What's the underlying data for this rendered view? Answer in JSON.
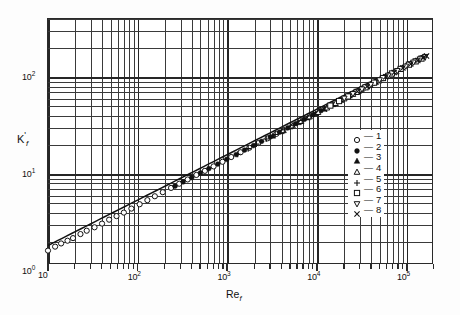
{
  "figure": {
    "background": "#fdfdfd",
    "frame_color": "#2a2a2a",
    "grid_color": "#3a3a3a"
  },
  "axes": {
    "x": {
      "label_text": "Re",
      "label_sub": "f",
      "ticks": [
        {
          "value": 10,
          "text": "10",
          "sup": ""
        },
        {
          "value": 100,
          "text": "10",
          "sup": "2"
        },
        {
          "value": 1000,
          "text": "10",
          "sup": "3"
        },
        {
          "value": 10000,
          "text": "10",
          "sup": "4"
        },
        {
          "value": 100000,
          "text": "10",
          "sup": "5"
        }
      ],
      "range": [
        10,
        200000
      ],
      "scale": "log"
    },
    "y": {
      "label_text": "K",
      "label_prime": "'",
      "label_sub": "f",
      "ticks": [
        {
          "value": 1,
          "text": "10",
          "sup": "0"
        },
        {
          "value": 10,
          "text": "10",
          "sup": "1"
        },
        {
          "value": 100,
          "text": "10",
          "sup": "2"
        }
      ],
      "range": [
        1.15,
        400
      ],
      "scale": "log"
    }
  },
  "legend": {
    "dash": "—",
    "entries": [
      {
        "id": "1",
        "symbol": "open-circle",
        "label": "1"
      },
      {
        "id": "2",
        "symbol": "filled-circle",
        "label": "2"
      },
      {
        "id": "3",
        "symbol": "filled-triangle-up",
        "label": "3"
      },
      {
        "id": "4",
        "symbol": "open-triangle-up",
        "label": "4"
      },
      {
        "id": "5",
        "symbol": "plus",
        "label": "5"
      },
      {
        "id": "6",
        "symbol": "open-square",
        "label": "6"
      },
      {
        "id": "7",
        "symbol": "open-triangle-down",
        "label": "7"
      },
      {
        "id": "8",
        "symbol": "cross",
        "label": "8"
      }
    ]
  },
  "chart_data": {
    "type": "scatter",
    "title": "",
    "subtitle": "",
    "xlabel": "Re_f",
    "ylabel": "K'_f",
    "xscale": "log",
    "yscale": "log",
    "xlim": [
      10,
      200000
    ],
    "ylim": [
      1.15,
      400
    ],
    "grid": true,
    "legend_position": "inside-lower-right",
    "xticks": [
      10,
      100,
      1000,
      10000,
      100000
    ],
    "xticklabels": [
      "10",
      "10^2",
      "10^3",
      "10^4",
      "10^5"
    ],
    "yticks": [
      1,
      10,
      100
    ],
    "yticklabels": [
      "10^0",
      "10^1",
      "10^2"
    ],
    "trendline": {
      "name": "correlation-line",
      "form": "K'_f = a * Re_f^b",
      "a": 0.62,
      "b": 0.47,
      "x_start": 10,
      "x_end": 160000,
      "y_start": 1.55,
      "y_end": 300
    },
    "series": [
      {
        "name": "1",
        "symbol": "open-circle",
        "points": [
          [
            10,
            1.62
          ],
          [
            12,
            1.78
          ],
          [
            14,
            1.92
          ],
          [
            16.5,
            2.05
          ],
          [
            19,
            2.18
          ],
          [
            23,
            2.4
          ],
          [
            27,
            2.6
          ],
          [
            33,
            2.82
          ],
          [
            40,
            3.08
          ],
          [
            48,
            3.38
          ],
          [
            58,
            3.68
          ],
          [
            70,
            4.0
          ],
          [
            85,
            4.4
          ],
          [
            105,
            4.88
          ],
          [
            128,
            5.38
          ],
          [
            155,
            5.9
          ],
          [
            190,
            6.5
          ],
          [
            235,
            7.2
          ],
          [
            290,
            7.95
          ],
          [
            360,
            8.8
          ],
          [
            450,
            9.8
          ],
          [
            560,
            10.8
          ],
          [
            700,
            12.0
          ],
          [
            880,
            13.4
          ],
          [
            1100,
            15.0
          ],
          [
            1400,
            16.8
          ],
          [
            1750,
            18.7
          ],
          [
            2200,
            20.9
          ],
          [
            2800,
            23.4
          ],
          [
            3500,
            26.0
          ]
        ]
      },
      {
        "name": "2",
        "symbol": "filled-circle",
        "points": [
          [
            260,
            7.5
          ],
          [
            320,
            8.3
          ],
          [
            400,
            9.2
          ],
          [
            500,
            10.3
          ],
          [
            620,
            11.4
          ],
          [
            780,
            12.7
          ],
          [
            980,
            14.2
          ],
          [
            1250,
            15.9
          ],
          [
            1550,
            17.7
          ],
          [
            1950,
            19.7
          ],
          [
            2400,
            21.8
          ],
          [
            3000,
            24.2
          ],
          [
            3800,
            27.1
          ],
          [
            4700,
            30.0
          ],
          [
            5800,
            33.2
          ],
          [
            7200,
            36.8
          ],
          [
            9000,
            41.0
          ],
          [
            11000,
            45.2
          ]
        ]
      },
      {
        "name": "3",
        "symbol": "filled-triangle-up",
        "points": [
          [
            3200,
            24.8
          ],
          [
            4000,
            27.6
          ],
          [
            5000,
            30.8
          ],
          [
            6200,
            34.2
          ],
          [
            7800,
            38.2
          ],
          [
            9600,
            42.3
          ],
          [
            12000,
            47.0
          ],
          [
            15000,
            52.5
          ],
          [
            18500,
            58.0
          ],
          [
            23000,
            64.5
          ],
          [
            29000,
            72.0
          ],
          [
            36000,
            80.0
          ],
          [
            45000,
            89.0
          ]
        ]
      },
      {
        "name": "4",
        "symbol": "open-triangle-up",
        "points": [
          [
            4200,
            28.3
          ],
          [
            5300,
            31.6
          ],
          [
            6600,
            35.2
          ],
          [
            8200,
            39.2
          ],
          [
            10200,
            43.6
          ],
          [
            12800,
            48.5
          ],
          [
            16000,
            54.0
          ],
          [
            20000,
            60.2
          ],
          [
            25000,
            67.0
          ],
          [
            31000,
            74.5
          ],
          [
            39000,
            83.0
          ],
          [
            49000,
            92.5
          ],
          [
            61000,
            103.0
          ],
          [
            76000,
            114.5
          ]
        ]
      },
      {
        "name": "5",
        "symbol": "plus",
        "points": [
          [
            1300,
            16.0
          ],
          [
            1700,
            18.3
          ],
          [
            2100,
            20.4
          ],
          [
            2700,
            23.0
          ],
          [
            3400,
            25.6
          ],
          [
            4300,
            28.7
          ],
          [
            5400,
            32.0
          ],
          [
            6800,
            35.8
          ],
          [
            8500,
            39.9
          ],
          [
            34000,
            78.0
          ],
          [
            43000,
            87.5
          ],
          [
            54000,
            97.5
          ]
        ]
      },
      {
        "name": "6",
        "symbol": "open-square",
        "points": [
          [
            14000,
            51.0
          ],
          [
            17500,
            56.8
          ],
          [
            22000,
            63.4
          ],
          [
            27500,
            70.6
          ],
          [
            34500,
            78.8
          ],
          [
            43000,
            88.0
          ],
          [
            54000,
            98.2
          ],
          [
            68000,
            109.5
          ],
          [
            85000,
            122.0
          ],
          [
            105000,
            135.0
          ],
          [
            125000,
            146.0
          ],
          [
            145000,
            156.0
          ]
        ]
      },
      {
        "name": "7",
        "symbol": "open-triangle-down",
        "points": [
          [
            20000,
            60.5
          ],
          [
            25000,
            67.4
          ],
          [
            31500,
            75.2
          ],
          [
            39500,
            83.9
          ],
          [
            49500,
            93.6
          ],
          [
            62000,
            104.5
          ],
          [
            78000,
            116.5
          ],
          [
            97000,
            129.5
          ],
          [
            118000,
            142.5
          ],
          [
            140000,
            154.0
          ],
          [
            160000,
            163.0
          ]
        ]
      },
      {
        "name": "8",
        "symbol": "cross",
        "points": [
          [
            9500,
            42.0
          ],
          [
            12000,
            47.0
          ],
          [
            28000,
            71.2
          ],
          [
            36000,
            80.5
          ],
          [
            58000,
            101.0
          ],
          [
            72000,
            112.0
          ],
          [
            90000,
            124.5
          ],
          [
            110000,
            137.0
          ],
          [
            132000,
            149.0
          ],
          [
            152000,
            159.5
          ],
          [
            165000,
            166.0
          ]
        ]
      }
    ]
  }
}
